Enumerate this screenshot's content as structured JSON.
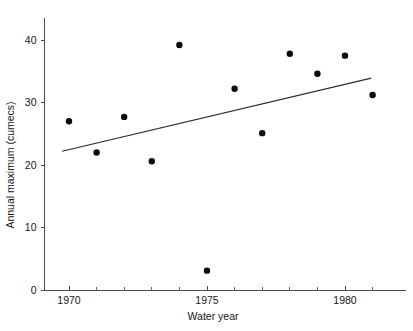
{
  "chart_data": {
    "type": "scatter",
    "title": "",
    "xlabel": "Water year",
    "ylabel": "Annual maximum (cumecs)",
    "xlim": [
      1968.8,
      1981.6
    ],
    "ylim": [
      0,
      44
    ],
    "grid": false,
    "legend": null,
    "x_ticks": [
      1970,
      1975,
      1980
    ],
    "x_tick_labels": [
      "1970",
      "1975",
      "1980"
    ],
    "x_minor_ticks": [
      1970,
      1971,
      1972,
      1973,
      1974,
      1975,
      1976,
      1977,
      1978,
      1979,
      1980,
      1981
    ],
    "y_ticks": [
      0,
      10,
      20,
      30,
      40
    ],
    "y_tick_labels": [
      "0",
      "10",
      "20",
      "30",
      "40"
    ],
    "series": [
      {
        "name": "Annual maximum",
        "marker": "filled-circle",
        "color": "#0b0b0b",
        "x": [
          1970,
          1971,
          1972,
          1973,
          1974,
          1975,
          1976,
          1977,
          1978,
          1979,
          1980,
          1981
        ],
        "y": [
          27.0,
          22.0,
          27.7,
          20.6,
          39.2,
          3.1,
          32.2,
          25.1,
          37.8,
          34.6,
          37.5,
          31.2
        ]
      }
    ],
    "trend_line": {
      "name": "Linear trend",
      "color": "#2b2b2b",
      "x_start": 1969.75,
      "y_start": 22.2,
      "x_end": 1980.95,
      "y_end": 33.9
    }
  }
}
